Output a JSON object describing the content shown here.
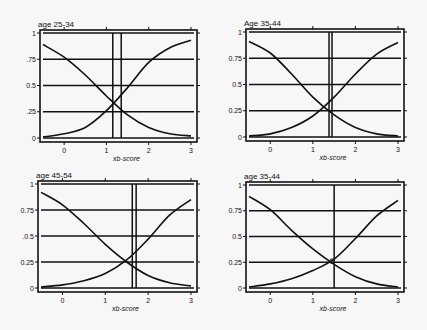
{
  "chart_data": [
    {
      "type": "line",
      "title": "age  25-34",
      "xlabel": "xb-score",
      "ylabel": "",
      "xlim": [
        -0.5,
        3
      ],
      "ylim": [
        0,
        1
      ],
      "xticks": [
        "0",
        "1",
        "2",
        "3"
      ],
      "yticks": [
        "0",
        ".25",
        "0.5",
        ".75",
        "1"
      ],
      "hlines": [
        0,
        0.25,
        0.5,
        0.75,
        1
      ],
      "vlines": [
        1.15,
        1.35
      ],
      "series": [
        {
          "name": "decreasing",
          "x": [
            -0.5,
            0,
            0.5,
            1,
            1.5,
            2,
            2.5,
            3
          ],
          "values": [
            0.89,
            0.77,
            0.6,
            0.4,
            0.22,
            0.1,
            0.04,
            0.02
          ]
        },
        {
          "name": "increasing",
          "x": [
            -0.5,
            0,
            0.5,
            1,
            1.5,
            2,
            2.5,
            3
          ],
          "values": [
            0.01,
            0.04,
            0.1,
            0.26,
            0.48,
            0.72,
            0.86,
            0.93
          ]
        }
      ]
    },
    {
      "type": "line",
      "title": "Age 35-44",
      "xlabel": "xb-score",
      "ylabel": "",
      "xlim": [
        -0.5,
        3
      ],
      "ylim": [
        0,
        1
      ],
      "xticks": [
        "0",
        "1",
        "2",
        "3"
      ],
      "yticks": [
        "0",
        "0.25",
        "0.5",
        "0.75",
        "1"
      ],
      "hlines": [
        0,
        0.25,
        0.5,
        0.75,
        1
      ],
      "vlines": [
        1.38,
        1.45
      ],
      "series": [
        {
          "name": "decreasing",
          "x": [
            -0.5,
            0,
            0.5,
            1,
            1.5,
            2,
            2.5,
            3
          ],
          "values": [
            0.91,
            0.8,
            0.6,
            0.38,
            0.21,
            0.09,
            0.03,
            0.01
          ]
        },
        {
          "name": "increasing",
          "x": [
            -0.5,
            0,
            0.5,
            1,
            1.5,
            2,
            2.5,
            3
          ],
          "values": [
            0.01,
            0.03,
            0.09,
            0.2,
            0.38,
            0.6,
            0.79,
            0.9
          ]
        }
      ]
    },
    {
      "type": "line",
      "title": "age 45-54",
      "xlabel": "xb-score",
      "ylabel": "",
      "xlim": [
        -0.5,
        3
      ],
      "ylim": [
        0,
        1
      ],
      "xticks": [
        "0",
        "1",
        "2",
        "3"
      ],
      "yticks": [
        "0",
        "0.25",
        ".0.5",
        "0.75",
        "1"
      ],
      "hlines": [
        0,
        0.25,
        0.5,
        0.75,
        1
      ],
      "vlines": [
        1.63,
        1.72
      ],
      "series": [
        {
          "name": "decreasing",
          "x": [
            -0.5,
            0,
            0.5,
            1,
            1.5,
            2,
            2.5,
            3
          ],
          "values": [
            0.92,
            0.8,
            0.62,
            0.42,
            0.25,
            0.12,
            0.05,
            0.02
          ]
        },
        {
          "name": "increasing",
          "x": [
            -0.5,
            0,
            0.5,
            1,
            1.5,
            2,
            2.5,
            3
          ],
          "values": [
            0.01,
            0.03,
            0.07,
            0.14,
            0.27,
            0.47,
            0.7,
            0.85
          ]
        }
      ]
    },
    {
      "type": "line",
      "title": "age 35-44",
      "xlabel": "xb-score",
      "ylabel": "",
      "xlim": [
        -0.5,
        3
      ],
      "ylim": [
        0,
        1
      ],
      "xticks": [
        "0",
        "1",
        "2",
        "3"
      ],
      "yticks": [
        "0",
        "0.25",
        "0.5",
        "0.75",
        "1"
      ],
      "hlines": [
        0,
        0.25,
        0.5,
        0.75,
        1
      ],
      "vlines": [
        1.5
      ],
      "marker": {
        "x": 1.45,
        "y": 0.26
      },
      "series": [
        {
          "name": "decreasing",
          "x": [
            -0.5,
            0,
            0.5,
            1,
            1.5,
            2,
            2.5,
            3
          ],
          "values": [
            0.89,
            0.76,
            0.56,
            0.38,
            0.23,
            0.11,
            0.04,
            0.01
          ]
        },
        {
          "name": "increasing",
          "x": [
            -0.5,
            0,
            0.5,
            1,
            1.5,
            2,
            2.5,
            3
          ],
          "values": [
            0.01,
            0.04,
            0.09,
            0.17,
            0.28,
            0.48,
            0.7,
            0.85
          ]
        }
      ]
    }
  ]
}
